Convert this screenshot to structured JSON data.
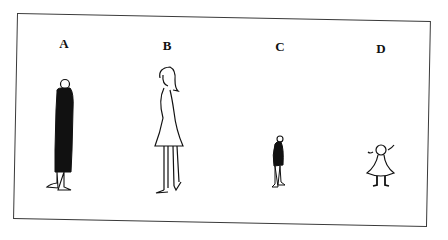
{
  "figure": {
    "panels": [
      {
        "label": "A",
        "description": "tall figure in dark long coat"
      },
      {
        "label": "B",
        "description": "tall woman in dress"
      },
      {
        "label": "C",
        "description": "short figure in dark coat"
      },
      {
        "label": "D",
        "description": "small girl in dress"
      }
    ]
  }
}
